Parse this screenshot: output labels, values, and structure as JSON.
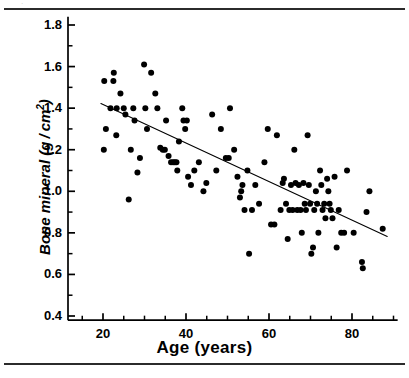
{
  "figure": {
    "background_color": "#ffffff",
    "ink_color": "#000000",
    "rule_color": "#2b2b2b",
    "top_rule": true,
    "bottom_rule": true,
    "scan_speck": "·"
  },
  "chart_data": {
    "type": "scatter",
    "title": "",
    "subtitle": "",
    "xlabel": "Age (years)",
    "ylabel": "Bone mineral (g/cm2)",
    "ylabel_main": "Bone mineral (g / cm",
    "ylabel_exponent": "2",
    "ylabel_close": ")",
    "xlim": [
      14,
      91
    ],
    "ylim": [
      0.38,
      1.84
    ],
    "grid": false,
    "legend": null,
    "legend_position": "none",
    "x_ticks_major": [
      20,
      40,
      60,
      80
    ],
    "x_tick_labels": [
      "20",
      "40",
      "60",
      "80"
    ],
    "x_ticks_minor": [
      15,
      25,
      30,
      35,
      45,
      50,
      55,
      65,
      70,
      75,
      85,
      90
    ],
    "y_ticks_major": [
      0.4,
      0.6,
      0.8,
      1.0,
      1.2,
      1.4,
      1.6,
      1.8
    ],
    "y_tick_labels": [
      "0.4",
      "0.6",
      "0.8",
      "1.0",
      "1.2",
      "1.4",
      "1.6",
      "1.8"
    ],
    "y_ticks_minor": [
      0.5,
      0.7,
      0.9,
      1.1,
      1.3,
      1.5,
      1.7
    ],
    "marker": {
      "shape": "circle",
      "color": "#000000",
      "size_px": 6
    },
    "trendline": {
      "type": "linear-regression",
      "color": "#000000",
      "width_px": 1.1,
      "x_start": 19.5,
      "y_start": 1.422,
      "x_end": 88.5,
      "y_end": 0.783
    },
    "points": [
      [
        20.3,
        1.53
      ],
      [
        20.7,
        1.3
      ],
      [
        20.2,
        1.2
      ],
      [
        21.8,
        1.4
      ],
      [
        22.5,
        1.53
      ],
      [
        22.6,
        1.57
      ],
      [
        23.3,
        1.4
      ],
      [
        23.2,
        1.27
      ],
      [
        24.2,
        1.47
      ],
      [
        25.0,
        1.4
      ],
      [
        25.4,
        1.37
      ],
      [
        26.2,
        0.96
      ],
      [
        26.7,
        1.2
      ],
      [
        27.3,
        1.4
      ],
      [
        27.6,
        1.34
      ],
      [
        28.3,
        1.09
      ],
      [
        28.9,
        1.16
      ],
      [
        29.9,
        1.61
      ],
      [
        30.2,
        1.4
      ],
      [
        30.6,
        1.3
      ],
      [
        31.6,
        1.57
      ],
      [
        32.6,
        1.47
      ],
      [
        33.1,
        1.4
      ],
      [
        33.8,
        1.21
      ],
      [
        34.4,
        1.2
      ],
      [
        34.9,
        1.2
      ],
      [
        35.2,
        1.34
      ],
      [
        35.8,
        1.17
      ],
      [
        36.4,
        1.14
      ],
      [
        36.9,
        1.14
      ],
      [
        37.3,
        1.14
      ],
      [
        37.7,
        1.14
      ],
      [
        37.9,
        1.1
      ],
      [
        38.3,
        1.24
      ],
      [
        39.1,
        1.4
      ],
      [
        39.4,
        1.34
      ],
      [
        39.8,
        1.3
      ],
      [
        40.2,
        1.34
      ],
      [
        40.5,
        1.07
      ],
      [
        41.2,
        1.03
      ],
      [
        42.0,
        1.1
      ],
      [
        43.1,
        1.14
      ],
      [
        44.2,
        1.0
      ],
      [
        44.9,
        1.04
      ],
      [
        46.3,
        1.37
      ],
      [
        47.3,
        1.1
      ],
      [
        48.4,
        1.3
      ],
      [
        49.6,
        1.16
      ],
      [
        50.3,
        1.16
      ],
      [
        50.6,
        1.4
      ],
      [
        51.6,
        1.2
      ],
      [
        52.4,
        1.07
      ],
      [
        53.0,
        0.97
      ],
      [
        53.3,
        1.0
      ],
      [
        53.6,
        1.03
      ],
      [
        54.1,
        0.91
      ],
      [
        54.8,
        1.1
      ],
      [
        55.2,
        0.7
      ],
      [
        55.9,
        0.91
      ],
      [
        56.7,
        1.03
      ],
      [
        57.6,
        0.94
      ],
      [
        58.9,
        1.14
      ],
      [
        59.7,
        1.3
      ],
      [
        60.5,
        0.84
      ],
      [
        61.3,
        0.84
      ],
      [
        61.9,
        1.27
      ],
      [
        62.8,
        0.91
      ],
      [
        63.3,
        1.04
      ],
      [
        63.6,
        1.06
      ],
      [
        64.1,
        0.94
      ],
      [
        64.5,
        0.77
      ],
      [
        64.9,
        0.91
      ],
      [
        65.3,
        1.03
      ],
      [
        65.7,
        0.91
      ],
      [
        66.1,
        1.2
      ],
      [
        66.4,
        1.04
      ],
      [
        66.8,
        0.91
      ],
      [
        67.2,
        1.03
      ],
      [
        67.6,
        0.91
      ],
      [
        67.9,
        0.8
      ],
      [
        68.3,
        1.04
      ],
      [
        68.6,
        0.94
      ],
      [
        68.9,
        0.91
      ],
      [
        69.3,
        1.27
      ],
      [
        69.6,
        1.03
      ],
      [
        69.9,
        0.94
      ],
      [
        70.2,
        0.7
      ],
      [
        70.6,
        0.73
      ],
      [
        70.9,
        0.91
      ],
      [
        71.3,
        1.0
      ],
      [
        71.6,
        0.94
      ],
      [
        71.9,
        0.8
      ],
      [
        72.3,
        1.1
      ],
      [
        72.6,
        1.03
      ],
      [
        72.9,
        0.91
      ],
      [
        73.3,
        0.94
      ],
      [
        73.6,
        0.87
      ],
      [
        74.0,
        1.06
      ],
      [
        74.3,
        1.0
      ],
      [
        74.6,
        0.94
      ],
      [
        74.9,
        0.91
      ],
      [
        75.3,
        0.87
      ],
      [
        75.8,
        1.07
      ],
      [
        76.3,
        0.73
      ],
      [
        76.8,
        0.91
      ],
      [
        77.4,
        0.8
      ],
      [
        78.1,
        0.8
      ],
      [
        78.8,
        1.1
      ],
      [
        80.4,
        0.8
      ],
      [
        82.4,
        0.66
      ],
      [
        82.6,
        0.63
      ],
      [
        83.5,
        0.9
      ],
      [
        84.2,
        1.0
      ],
      [
        87.4,
        0.82
      ]
    ]
  }
}
